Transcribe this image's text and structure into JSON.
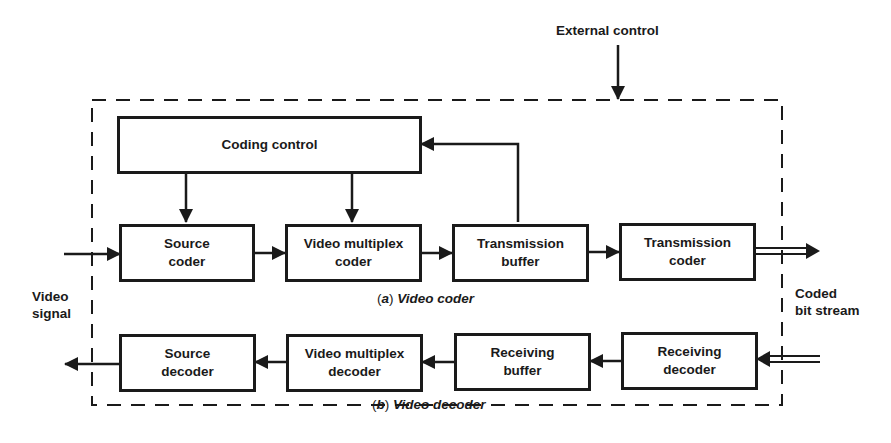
{
  "diagram": {
    "external_control": "External control",
    "input_label": [
      "Video",
      "signal"
    ],
    "output_label": [
      "Coded",
      "bit stream"
    ],
    "coder": {
      "caption_letter": "a",
      "caption_text": "Video coder",
      "coding_control": "Coding control",
      "blocks": [
        {
          "line1": "Source",
          "line2": "coder"
        },
        {
          "line1": "Video multiplex",
          "line2": "coder"
        },
        {
          "line1": "Transmission",
          "line2": "buffer"
        },
        {
          "line1": "Transmission",
          "line2": "coder"
        }
      ]
    },
    "decoder": {
      "caption_letter": "b",
      "caption_text": "Video decoder",
      "blocks": [
        {
          "line1": "Source",
          "line2": "decoder"
        },
        {
          "line1": "Video multiplex",
          "line2": "decoder"
        },
        {
          "line1": "Receiving",
          "line2": "buffer"
        },
        {
          "line1": "Receiving",
          "line2": "decoder"
        }
      ]
    }
  }
}
